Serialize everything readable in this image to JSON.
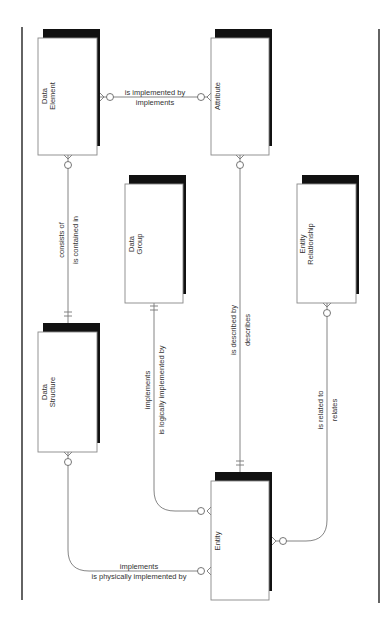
{
  "diagram": {
    "type": "entity-relationship",
    "entities": [
      {
        "id": "data_element",
        "line1": "Data",
        "line2": "Element"
      },
      {
        "id": "attribute",
        "line1": "Attribute",
        "line2": ""
      },
      {
        "id": "data_group",
        "line1": "Data",
        "line2": "Group"
      },
      {
        "id": "entity_relationship",
        "line1": "Entity",
        "line2": "Relationship"
      },
      {
        "id": "data_structure",
        "line1": "Data",
        "line2": "Structure"
      },
      {
        "id": "entity",
        "line1": "Entity",
        "line2": ""
      }
    ],
    "relationships": [
      {
        "id": "element_attribute",
        "from": "Data Element",
        "to": "Attribute",
        "label1": "is implemented by",
        "label2": "implements"
      },
      {
        "id": "element_structure",
        "from": "Data Element",
        "to": "Data Structure",
        "label1": "consists of",
        "label2": "is contained in"
      },
      {
        "id": "attribute_entity",
        "from": "Attribute",
        "to": "Entity",
        "label1": "is described by",
        "label2": "describes"
      },
      {
        "id": "group_entity",
        "from": "Data Group",
        "to": "Entity",
        "label1": "implements",
        "label2": "is logically implemented by"
      },
      {
        "id": "er_entity",
        "from": "Entity Relationship",
        "to": "Entity",
        "label1": "is related to",
        "label2": "relates"
      },
      {
        "id": "structure_entity",
        "from": "Data Structure",
        "to": "Entity",
        "label1": "implements",
        "label2": "is physically implemented by"
      }
    ]
  }
}
